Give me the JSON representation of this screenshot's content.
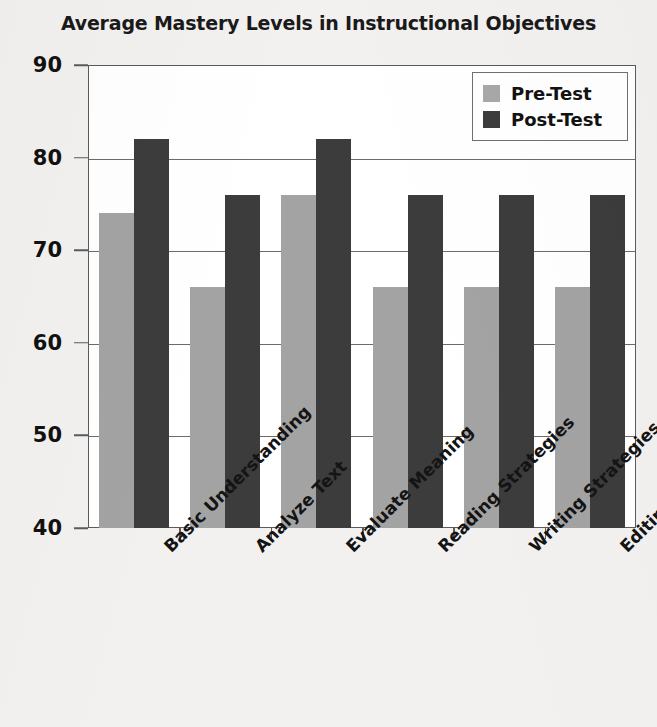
{
  "chart_data": {
    "type": "bar",
    "title": "Average Mastery Levels in Instructional Objectives",
    "xlabel": "",
    "ylabel": "",
    "ylim": [
      40,
      90
    ],
    "ytick_step": 10,
    "yticks": [
      90,
      80,
      70,
      60,
      50,
      40
    ],
    "grid": true,
    "legend_position": "top-right",
    "categories": [
      "Basic Understanding",
      "Analyze Text",
      "Evaluate Meaning",
      "Reading Strategies",
      "Writing Strategies",
      "Editing Skills"
    ],
    "series": [
      {
        "name": "Pre-Test",
        "color": "#a3a3a3",
        "values": [
          74,
          66,
          76,
          66,
          66,
          66
        ]
      },
      {
        "name": "Post-Test",
        "color": "#3c3c3c",
        "values": [
          82,
          76,
          82,
          76,
          76,
          76
        ]
      }
    ]
  },
  "legend": {
    "entries": [
      {
        "label": "Pre-Test",
        "swatch": "pre"
      },
      {
        "label": "Post-Test",
        "swatch": "post"
      }
    ]
  },
  "colors": {
    "pre_test": "#a3a3a3",
    "post_test": "#3c3c3c",
    "page_background": "#f2f1ef",
    "plot_background": "#ffffff",
    "axis_line": "#5b5b5b",
    "text": "#141414"
  }
}
